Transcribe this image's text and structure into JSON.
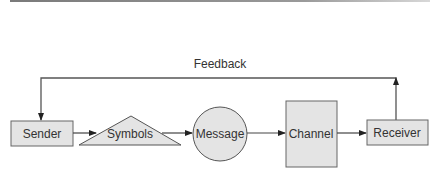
{
  "diagram": {
    "feedback_label": "Feedback",
    "nodes": [
      {
        "id": "sender",
        "label": "Sender",
        "shape": "rectangle"
      },
      {
        "id": "symbols",
        "label": "Symbols",
        "shape": "triangle"
      },
      {
        "id": "message",
        "label": "Message",
        "shape": "circle"
      },
      {
        "id": "channel",
        "label": "Channel",
        "shape": "rectangle"
      },
      {
        "id": "receiver",
        "label": "Receiver",
        "shape": "rectangle"
      }
    ],
    "edges": [
      {
        "from": "sender",
        "to": "symbols"
      },
      {
        "from": "symbols",
        "to": "message"
      },
      {
        "from": "message",
        "to": "channel"
      },
      {
        "from": "channel",
        "to": "receiver"
      },
      {
        "from": "receiver",
        "to": "sender",
        "label": "Feedback"
      }
    ]
  },
  "colors": {
    "fill": "#e4e4e4",
    "stroke": "#555555",
    "text": "#333333"
  }
}
